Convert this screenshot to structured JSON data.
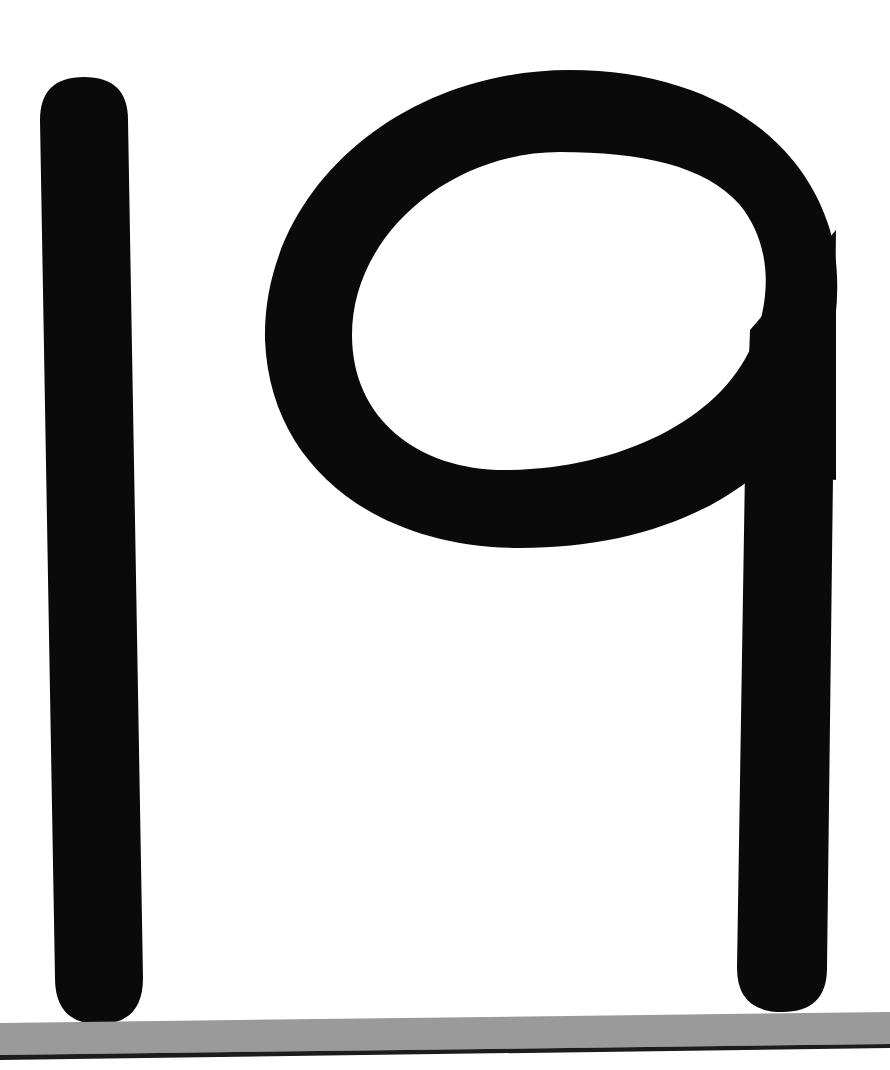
{
  "figure": {
    "number_text": "19",
    "digits": [
      {
        "glyph": "1",
        "name": "digit-one"
      },
      {
        "glyph": "9",
        "name": "digit-nine"
      }
    ]
  },
  "colors": {
    "background": "#ffffff",
    "ink": "#0a0a0a",
    "band_fill": "#9a9a9a",
    "band_edge": "#1c1c1c"
  }
}
